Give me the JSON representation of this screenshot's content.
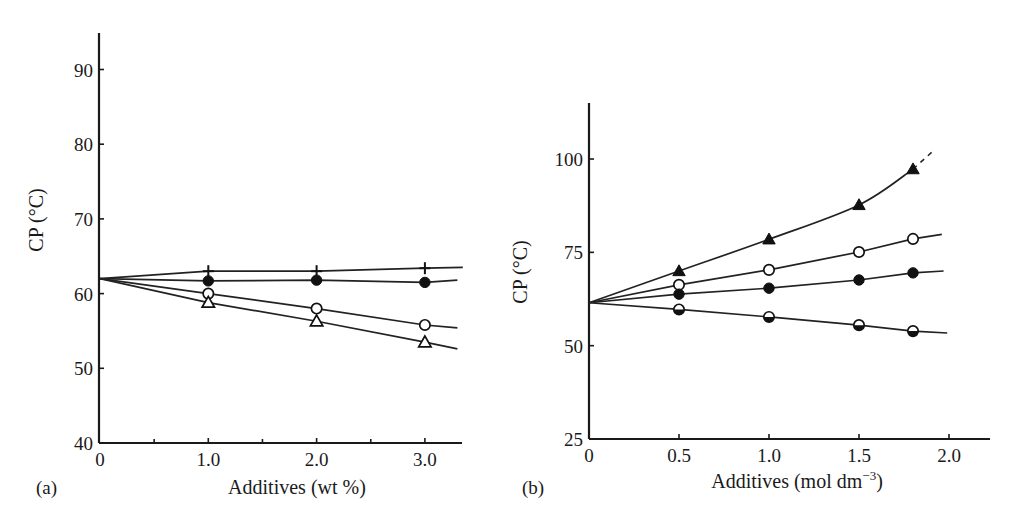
{
  "figure": {
    "panel_a_label": "(a)",
    "panel_b_label": "(b)"
  },
  "chart_data": [
    {
      "type": "line",
      "panel": "(a)",
      "title": "",
      "xlabel": "Additives (wt %)",
      "ylabel": "CP (°C)",
      "xlim": [
        0,
        3.35
      ],
      "ylim": [
        40,
        95
      ],
      "xticks": [
        0,
        1.0,
        2.0,
        3.0
      ],
      "xtick_labels": [
        "0",
        "1.0",
        "2.0",
        "3.0"
      ],
      "minor_xticks": [
        0.5,
        1.5,
        2.5
      ],
      "yticks": [
        40,
        50,
        60,
        70,
        80,
        90
      ],
      "ytick_labels": [
        "40",
        "50",
        "60",
        "70",
        "80",
        "90"
      ],
      "grid": false,
      "legend": null,
      "series": [
        {
          "name": "plus",
          "marker": "plus",
          "x": [
            0,
            1.0,
            2.0,
            3.0
          ],
          "y": [
            62,
            63.0,
            63.0,
            63.4
          ],
          "line_end": [
            3.35,
            63.5
          ]
        },
        {
          "name": "filled-circle",
          "marker": "filled-circle",
          "x": [
            0,
            1.0,
            2.0,
            3.0
          ],
          "y": [
            62,
            61.7,
            61.8,
            61.5
          ],
          "line_end": [
            3.3,
            61.8
          ]
        },
        {
          "name": "open-circle",
          "marker": "open-circle",
          "x": [
            0,
            1.0,
            2.0,
            3.0
          ],
          "y": [
            62,
            60.0,
            58.0,
            55.8
          ],
          "line_end": [
            3.3,
            55.4
          ]
        },
        {
          "name": "open-triangle",
          "marker": "open-triangle",
          "x": [
            0,
            1.0,
            2.0,
            3.0
          ],
          "y": [
            62,
            58.8,
            56.3,
            53.5
          ],
          "line_end": [
            3.3,
            52.6
          ]
        }
      ]
    },
    {
      "type": "line",
      "panel": "(b)",
      "title": "",
      "xlabel": "Additives (mol dm",
      "xlabel_superscript": "−3",
      "xlabel_suffix": ")",
      "ylabel": "CP (°C)",
      "xlim": [
        0,
        2.23
      ],
      "ylim": [
        25,
        115
      ],
      "xticks": [
        0,
        0.5,
        1.0,
        1.5,
        2.0
      ],
      "xtick_labels": [
        "0",
        "0.5",
        "1.0",
        "1.5",
        "2.0"
      ],
      "yticks": [
        25,
        50,
        75,
        100
      ],
      "ytick_labels": [
        "25",
        "50",
        "75",
        "100"
      ],
      "grid": false,
      "legend": null,
      "series": [
        {
          "name": "filled-triangle",
          "marker": "filled-triangle",
          "x": [
            0,
            0.5,
            1.0,
            1.5,
            1.8
          ],
          "y": [
            61.5,
            70.0,
            78.5,
            87.7,
            97.3
          ],
          "curve": true,
          "dashed_extension": [
            [
              1.8,
              97.3
            ],
            [
              1.92,
              102.5
            ]
          ]
        },
        {
          "name": "open-circle",
          "marker": "open-circle",
          "x": [
            0,
            0.5,
            1.0,
            1.5,
            1.8
          ],
          "y": [
            61.5,
            66.3,
            70.3,
            75.1,
            78.6
          ],
          "line_end": [
            1.96,
            79.8
          ]
        },
        {
          "name": "filled-circle",
          "marker": "filled-circle",
          "x": [
            0,
            0.5,
            1.0,
            1.5,
            1.8
          ],
          "y": [
            61.5,
            63.8,
            65.4,
            67.6,
            69.5
          ],
          "line_end": [
            1.97,
            70.0
          ]
        },
        {
          "name": "half-filled-circle",
          "marker": "half-filled-circle",
          "x": [
            0,
            0.5,
            1.0,
            1.5,
            1.8
          ],
          "y": [
            61.5,
            59.7,
            57.7,
            55.5,
            53.9
          ],
          "line_end": [
            1.99,
            53.4
          ]
        }
      ]
    }
  ]
}
